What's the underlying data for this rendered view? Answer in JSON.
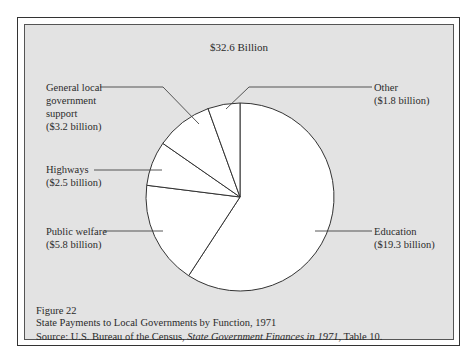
{
  "chart_data": {
    "type": "pie",
    "title": "$32.6 Billion",
    "total_billion": 32.6,
    "categories": [
      "Education",
      "Public welfare",
      "Highways",
      "General local government support",
      "Other"
    ],
    "values": [
      19.3,
      5.8,
      2.5,
      3.2,
      1.8
    ],
    "unit": "billion dollars",
    "start_angle": "12 o'clock, clockwise",
    "legend": "leader-line labels",
    "labels": [
      {
        "name": "Education",
        "value_text": "($19.3 billion)"
      },
      {
        "name": "Public welfare",
        "value_text": "($5.8 billion)"
      },
      {
        "name": "Highways",
        "value_text": "($2.5 billion)"
      },
      {
        "name": "General local government support",
        "value_text": "($3.2 billion)"
      },
      {
        "name": "Other",
        "value_text": "($1.8 billion)"
      }
    ]
  },
  "chart": {
    "title": "$32.6 Billion",
    "labels": {
      "general_1": "General local",
      "general_2": "government",
      "general_3": "support",
      "general_4": "($3.2 billion)",
      "highways_1": "Highways",
      "highways_2": "($2.5 billion)",
      "welfare_1": "Public welfare",
      "welfare_2": "($5.8 billion)",
      "other_1": "Other",
      "other_2": "($1.8 billion)",
      "education_1": "Education",
      "education_2": "($19.3 billion)"
    }
  },
  "caption": {
    "figure": "Figure 22",
    "title": "State Payments to Local Governments by Function, 1971",
    "source_prefix": "Source:  U.S. Bureau of the Census, ",
    "source_italic": "State Government Finances in 1971",
    "source_suffix": ", Table 10."
  },
  "colors": {
    "background": "#e3e3e3",
    "slice_fill": "#ffffff",
    "stroke": "#333333"
  }
}
